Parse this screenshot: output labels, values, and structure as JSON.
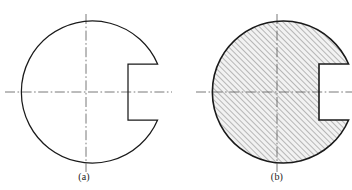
{
  "sheet": {
    "background_color": "#ffffff",
    "line_color": "#1a1a1a",
    "centerline_color": "#555555",
    "hatch_color": "#3a3a3a",
    "fill_color": "#f2f2f2",
    "width": 352,
    "height": 190
  },
  "figures": [
    {
      "id": "figure-a",
      "caption": "(a)",
      "description": "circular-disc-with-keyway-notch-outline",
      "sectioned": false,
      "circle": {
        "cx": 86,
        "cy": 92,
        "r": 71
      },
      "notch": {
        "left_x": 128,
        "top_y": 64,
        "bottom_y": 118,
        "opens_to": "right"
      },
      "centerlines": {
        "horizontal": {
          "x1": 5,
          "y1": 92,
          "x2": 172,
          "y2": 92
        },
        "vertical": {
          "x1": 86,
          "y1": 14,
          "x2": 86,
          "y2": 172
        }
      }
    },
    {
      "id": "figure-b",
      "caption": "(b)",
      "description": "circular-disc-with-keyway-notch-section-hatched",
      "sectioned": true,
      "hatch": {
        "angle_degrees": 45,
        "spacing_px": 4,
        "direction": "lower-left-to-upper-right"
      },
      "circle": {
        "cx": 277,
        "cy": 92,
        "r": 71
      },
      "notch": {
        "left_x": 319,
        "top_y": 64,
        "bottom_y": 118,
        "opens_to": "right"
      },
      "centerlines": {
        "horizontal": {
          "x1": 196,
          "y1": 92,
          "x2": 352,
          "y2": 92
        },
        "vertical": {
          "x1": 277,
          "y1": 14,
          "x2": 277,
          "y2": 172
        }
      }
    }
  ]
}
